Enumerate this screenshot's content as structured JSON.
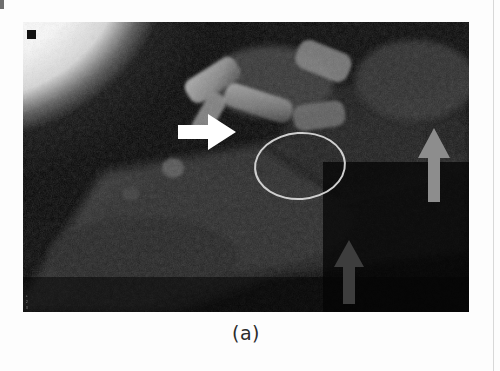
{
  "figure": {
    "caption": "(a)",
    "panel_label": "(a)",
    "modality_note": "radiographic grayscale image",
    "burned_in_text": [
      "1",
      "2",
      "3"
    ],
    "corner_marker": "black-square",
    "background_color": "#050505",
    "page_color": "#fdfdfd"
  },
  "annotations": {
    "white_arrow": {
      "name": "white-arrow",
      "label": "white arrow pointing right",
      "direction": "right",
      "color": "#ffffff"
    },
    "gray_arrow_right": {
      "name": "gray-arrow-upper-right",
      "label": "gray arrow pointing up",
      "direction": "up",
      "color": "#8d8d8d"
    },
    "gray_arrow_lower": {
      "name": "gray-arrow-lower-center",
      "label": "dark gray arrow pointing up",
      "direction": "up",
      "color": "#3d3d3d"
    },
    "ellipse": {
      "name": "ellipse-marker",
      "label": "ellipse region of interest",
      "color": "#cfcfcf"
    }
  }
}
